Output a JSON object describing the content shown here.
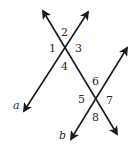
{
  "diagram": {
    "lines": {
      "transversal": {
        "label": ""
      },
      "a": {
        "label": "a"
      },
      "b": {
        "label": "b"
      }
    },
    "angles": [
      {
        "id": 1,
        "label": "1"
      },
      {
        "id": 2,
        "label": "2"
      },
      {
        "id": 3,
        "label": "3"
      },
      {
        "id": 4,
        "label": "4"
      },
      {
        "id": 5,
        "label": "5"
      },
      {
        "id": 6,
        "label": "6"
      },
      {
        "id": 7,
        "label": "7"
      },
      {
        "id": 8,
        "label": "8"
      }
    ],
    "line_color": "#1a1a1a",
    "text_color": "#2a2a2a"
  }
}
